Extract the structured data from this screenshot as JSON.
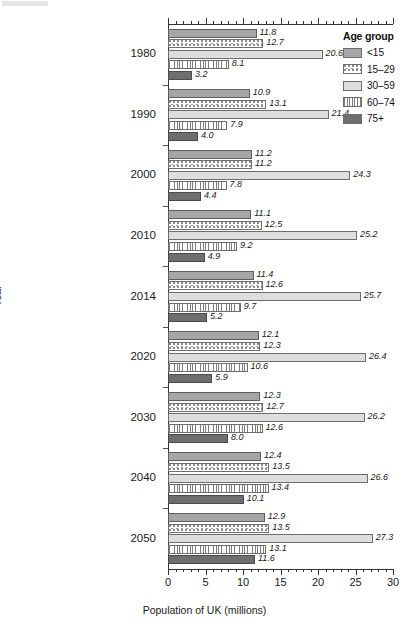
{
  "chart_data": {
    "type": "bar",
    "orientation": "horizontal",
    "grouped": true,
    "title": "",
    "xlabel": "Population of UK (millions)",
    "ylabel": "Year",
    "xlim": [
      0,
      30
    ],
    "xticks": [
      0,
      5,
      10,
      15,
      20,
      25,
      30
    ],
    "xtick_labels": [
      "0",
      "5",
      "10",
      "15",
      "20",
      "25",
      "30"
    ],
    "minor_tick_step": 1,
    "grid": false,
    "legend_title": "Age group",
    "legend_position": "top-right",
    "categories": [
      "1980",
      "1990",
      "2000",
      "2010",
      "2014",
      "2020",
      "2030",
      "2040",
      "2050"
    ],
    "series": [
      {
        "name": "<15",
        "key": "lt15",
        "values": [
          11.8,
          10.9,
          11.2,
          11.1,
          11.4,
          12.1,
          12.3,
          12.4,
          12.9
        ],
        "fill": "gray-solid",
        "color": "#a6a6a6"
      },
      {
        "name": "15–29",
        "key": "a15_29",
        "values": [
          12.7,
          13.1,
          11.2,
          12.5,
          12.6,
          12.3,
          12.7,
          13.5,
          13.5
        ],
        "fill": "dotted",
        "color": "#ffffff"
      },
      {
        "name": "30–59",
        "key": "a30_59",
        "values": [
          20.6,
          21.4,
          24.3,
          25.2,
          25.7,
          26.4,
          26.2,
          26.6,
          27.3
        ],
        "fill": "light-solid",
        "color": "#dedede"
      },
      {
        "name": "60–74",
        "key": "a60_74",
        "values": [
          8.1,
          7.9,
          7.8,
          9.2,
          9.7,
          10.6,
          12.6,
          13.4,
          13.1
        ],
        "fill": "vertical-lines",
        "color": "#ffffff"
      },
      {
        "name": "75+",
        "key": "a75plus",
        "values": [
          3.2,
          4.0,
          4.4,
          4.9,
          5.2,
          5.9,
          8.0,
          10.1,
          11.6
        ],
        "fill": "dark-solid",
        "color": "#6e6e6e"
      }
    ],
    "value_labels": {
      "1980": [
        "11.8",
        "12.7",
        "20.6",
        "8.1",
        "3.2"
      ],
      "1990": [
        "10.9",
        "13.1",
        "21.4",
        "7.9",
        "4.0"
      ],
      "2000": [
        "11.2",
        "11.2",
        "24.3",
        "7.8",
        "4.4"
      ],
      "2010": [
        "11.1",
        "12.5",
        "25.2",
        "9.2",
        "4.9"
      ],
      "2014": [
        "11.4",
        "12.6",
        "25.7",
        "9.7",
        "5.2"
      ],
      "2020": [
        "12.1",
        "12.3",
        "26.4",
        "10.6",
        "5.9"
      ],
      "2030": [
        "12.3",
        "12.7",
        "26.2",
        "12.6",
        "8.0"
      ],
      "2040": [
        "12.4",
        "13.5",
        "26.6",
        "13.4",
        "10.1"
      ],
      "2050": [
        "12.9",
        "13.5",
        "27.3",
        "13.1",
        "11.6"
      ]
    }
  },
  "legend": {
    "title": "Age group",
    "items": [
      {
        "label": "<15"
      },
      {
        "label": "15–29"
      },
      {
        "label": "30–59"
      },
      {
        "label": "60–74"
      },
      {
        "label": "75+"
      }
    ]
  },
  "axes": {
    "x_title": "Population of UK (millions)",
    "y_title": "Year",
    "x_tick_labels": [
      "0",
      "5",
      "10",
      "15",
      "20",
      "25",
      "30"
    ],
    "y_tick_labels": [
      "1980",
      "1990",
      "2000",
      "2010",
      "2014",
      "2020",
      "2030",
      "2040",
      "2050"
    ]
  }
}
